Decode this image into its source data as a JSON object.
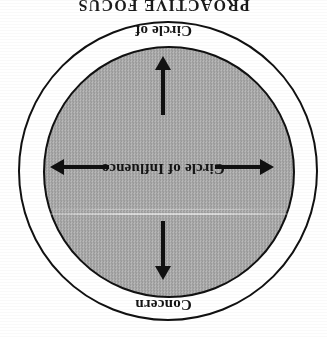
{
  "figure": {
    "title": "PROACTIVE FOCUS",
    "orientation_note": "180-degree-rotated-scan",
    "outer_label_line1": "Circle of",
    "outer_label_line2": "Concern",
    "inner_label": "Circle of Influence",
    "colors": {
      "ink": "#111111",
      "inner_fill_dark": "#8e8e8e",
      "inner_fill_light": "#c9c9c9",
      "outer_fill": "#ffffff",
      "page": "#ffffff"
    },
    "arrows": [
      {
        "name": "arrow-up",
        "direction": "up"
      },
      {
        "name": "arrow-right",
        "direction": "right"
      },
      {
        "name": "arrow-down",
        "direction": "down"
      },
      {
        "name": "arrow-left",
        "direction": "left"
      }
    ]
  }
}
